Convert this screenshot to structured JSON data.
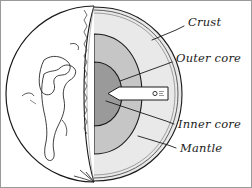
{
  "figure": {
    "style": "hand-drawn line illustration, grayscale",
    "background_color": "#ffffff",
    "border_color": "#8c8c8c"
  },
  "labels": [
    {
      "id": "crust",
      "text": "Crust",
      "x": 188,
      "y": 22,
      "leader_from": [
        182,
        26
      ],
      "leader_to": [
        154,
        40
      ]
    },
    {
      "id": "outer_core",
      "text": "Outer core",
      "x": 176,
      "y": 58,
      "leader_from": [
        170,
        62
      ],
      "leader_to": [
        118,
        80
      ]
    },
    {
      "id": "inner_core",
      "text": "Inner core",
      "x": 178,
      "y": 128,
      "leader_from": [
        172,
        124
      ],
      "leader_to": [
        104,
        102
      ]
    },
    {
      "id": "mantle",
      "text": "Mantle",
      "x": 180,
      "y": 152,
      "leader_from": [
        174,
        148
      ],
      "leader_to": [
        136,
        136
      ]
    }
  ],
  "layers": [
    {
      "id": "crust",
      "name": "Crust",
      "color": "#ffffff"
    },
    {
      "id": "mantle",
      "name": "Mantle",
      "color": "#e6e6e6"
    },
    {
      "id": "outer_core",
      "name": "Outer core",
      "color": "#c6c6c6"
    },
    {
      "id": "inner_core",
      "name": "Inner core",
      "color": "#9a9a9a"
    }
  ],
  "globe": {
    "center_x": 94,
    "center_y": 94,
    "radius": 88,
    "surface_color": "#ffffff",
    "outline_color": "#1a1a1a",
    "landmass_name": "continent-outline"
  },
  "pointer": {
    "name": "inner-core-pointer-arrow",
    "fill": "#ffffff",
    "tip_x": 108,
    "tail_x": 168,
    "y": 93
  }
}
